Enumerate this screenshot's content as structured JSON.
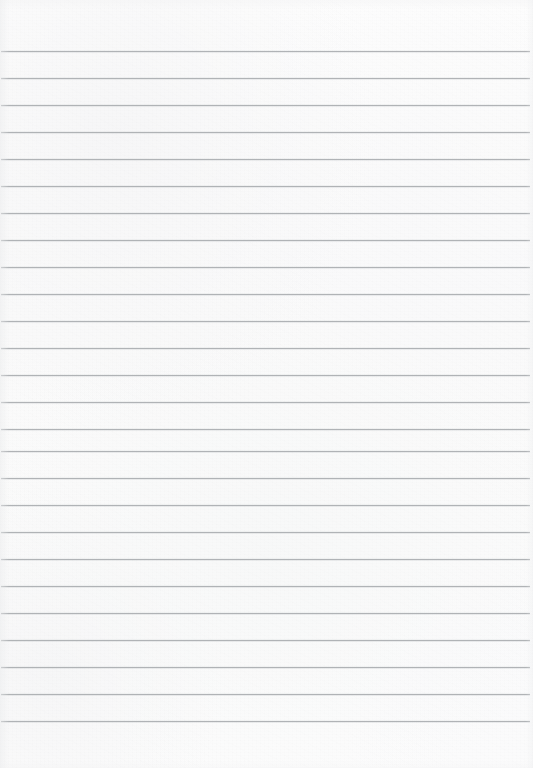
{
  "document": {
    "kind": "ruled-paper-scan",
    "description": "Blank scanned sheet of lined notebook paper",
    "page_width": 533,
    "page_height": 768,
    "written_content": "",
    "text_lines": []
  },
  "paper": {
    "background_color": "#fbfbfb",
    "edge_shade_color": "#ecedee",
    "texture": "fibrous-grain"
  },
  "ruling": {
    "line_color": "#a9acaf",
    "line_thickness_px": 1,
    "line_spacing_px": 27,
    "first_line_y": 51,
    "line_count": 26,
    "left_margin_px": 1,
    "right_margin_px": 3,
    "bottom_margin_px": 47,
    "margin_rule": "none",
    "lines": [
      {
        "index": 1,
        "y": 51,
        "x_start": 1,
        "x_end": 530
      },
      {
        "index": 2,
        "y": 78,
        "x_start": 1,
        "x_end": 530
      },
      {
        "index": 3,
        "y": 105,
        "x_start": 1,
        "x_end": 530
      },
      {
        "index": 4,
        "y": 132,
        "x_start": 1,
        "x_end": 530
      },
      {
        "index": 5,
        "y": 159,
        "x_start": 1,
        "x_end": 530
      },
      {
        "index": 6,
        "y": 186,
        "x_start": 1,
        "x_end": 530
      },
      {
        "index": 7,
        "y": 213,
        "x_start": 1,
        "x_end": 530
      },
      {
        "index": 8,
        "y": 240,
        "x_start": 1,
        "x_end": 530
      },
      {
        "index": 9,
        "y": 267,
        "x_start": 1,
        "x_end": 530
      },
      {
        "index": 10,
        "y": 294,
        "x_start": 1,
        "x_end": 530
      },
      {
        "index": 11,
        "y": 321,
        "x_start": 1,
        "x_end": 530
      },
      {
        "index": 12,
        "y": 348,
        "x_start": 1,
        "x_end": 530
      },
      {
        "index": 13,
        "y": 375,
        "x_start": 1,
        "x_end": 530
      },
      {
        "index": 14,
        "y": 402,
        "x_start": 1,
        "x_end": 530
      },
      {
        "index": 15,
        "y": 429,
        "x_start": 1,
        "x_end": 530
      },
      {
        "index": 16,
        "y": 451,
        "x_start": 1,
        "x_end": 530
      },
      {
        "index": 17,
        "y": 478,
        "x_start": 1,
        "x_end": 530
      },
      {
        "index": 18,
        "y": 505,
        "x_start": 1,
        "x_end": 530
      },
      {
        "index": 19,
        "y": 532,
        "x_start": 1,
        "x_end": 530
      },
      {
        "index": 20,
        "y": 559,
        "x_start": 1,
        "x_end": 530
      },
      {
        "index": 21,
        "y": 586,
        "x_start": 1,
        "x_end": 530
      },
      {
        "index": 22,
        "y": 613,
        "x_start": 1,
        "x_end": 530
      },
      {
        "index": 23,
        "y": 640,
        "x_start": 1,
        "x_end": 530
      },
      {
        "index": 24,
        "y": 667,
        "x_start": 1,
        "x_end": 530
      },
      {
        "index": 25,
        "y": 694,
        "x_start": 1,
        "x_end": 530
      },
      {
        "index": 26,
        "y": 721,
        "x_start": 1,
        "x_end": 530
      }
    ]
  }
}
